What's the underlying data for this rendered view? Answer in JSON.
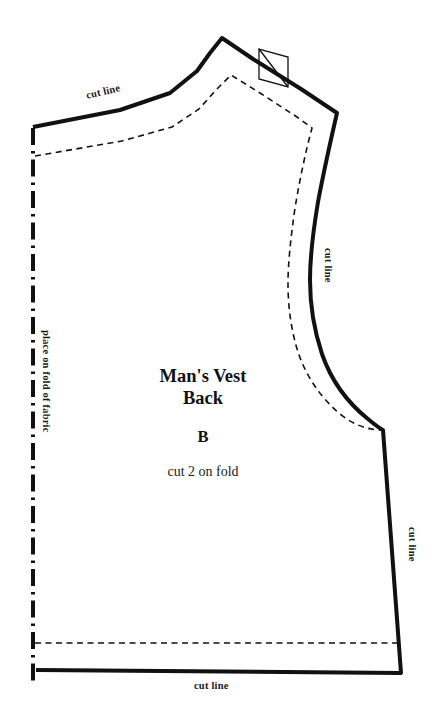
{
  "document": {
    "kind": "sewing-pattern-piece",
    "background_color": "#ffffff",
    "ink_color": "#111111"
  },
  "piece": {
    "title_line1": "Man's Vest",
    "title_line2": "Back",
    "letter": "B",
    "instruction": "cut 2 on fold"
  },
  "labels": {
    "cut_shoulder": "cut line",
    "cut_armhole": "cut line",
    "cut_side": "cut line",
    "cut_hem": "cut line",
    "place_on_fold": "place on fold of fabric"
  },
  "markings": {
    "fold_line_name": "fold-line-dash-dot",
    "seam_line_name": "seam-line-dashed",
    "cut_line_name": "cut-line-solid",
    "notch_name": "shoulder-notch-bowtie"
  },
  "geometry": {
    "canvas": {
      "width": 441,
      "height": 721
    },
    "fold_line": {
      "x": 33,
      "y_top": 130,
      "y_bottom": 684
    },
    "cut_line_path": "M 33 127 L 118 110 L 168 94 L 196 72 L 211 52 L 222 38 L 252 58 L 300 88 L 337 113 L 329 147 L 320 186 L 313 230 L 310 268 L 311 300 L 316 334 L 327 366 L 344 394 L 364 416 L 383 430 L 401 673 L 36 670",
    "seam_line_path": "M 35 156 L 120 142 L 170 128 L 198 110 L 214 92 L 230 75 L 258 92 L 296 116 L 311 127 L 304 166 L 296 205 L 290 246 L 288 282 L 290 312 L 296 342 L 307 369 L 324 394 L 346 414 L 370 430 L 383 430 M 36 643 L 399 643",
    "notch_points": "258 78 258 49 287 57 287 86",
    "side_seam_top": {
      "x": 383,
      "y": 430
    },
    "hem_dashed_y": 643,
    "hem_cut_y": 670
  }
}
